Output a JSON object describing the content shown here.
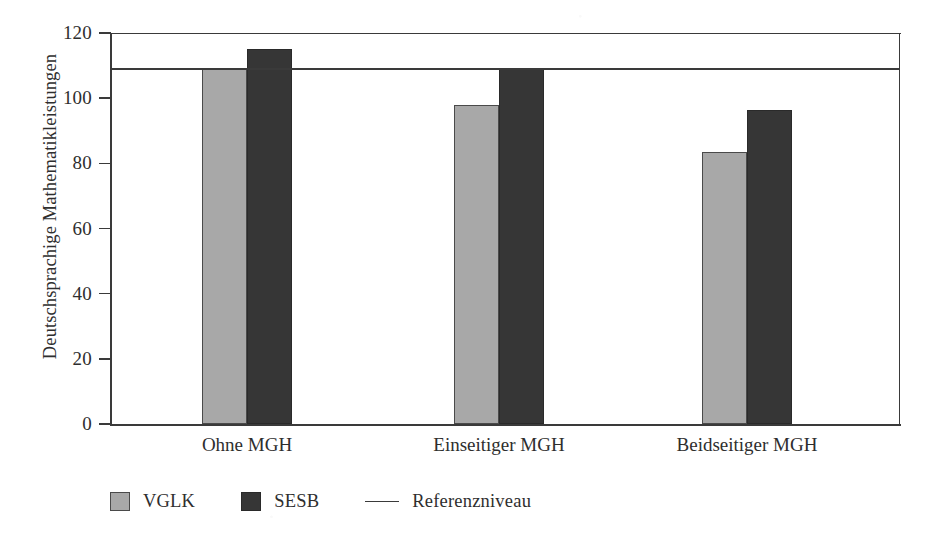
{
  "chart_data": {
    "type": "bar",
    "title": "",
    "subtitle": "",
    "xlabel": "",
    "ylabel": "Deutschsprachige Mathematikleistungen",
    "categories": [
      "Ohne MGH",
      "Einseitiger MGH",
      "Beidseitiger MGH"
    ],
    "series": [
      {
        "name": "VGLK",
        "color": "#a8a8a8",
        "values": [
          109,
          98,
          83.5
        ]
      },
      {
        "name": "SESB",
        "color": "#363636",
        "values": [
          115,
          109,
          96.5
        ]
      }
    ],
    "reference_line": {
      "label": "Referenzniveau",
      "value": 109,
      "color": "#3a3a3a"
    },
    "ylim": [
      0,
      120
    ],
    "yticks": [
      0,
      20,
      40,
      60,
      80,
      100,
      120
    ],
    "ytick_labels": [
      "0",
      "20",
      "40",
      "60",
      "80",
      "100",
      "120"
    ],
    "grid": false,
    "legend_position": "bottom-left",
    "legend_entries": [
      {
        "label": "VGLK",
        "marker": "square",
        "color": "#a8a8a8"
      },
      {
        "label": "SESB",
        "marker": "square",
        "color": "#363636"
      },
      {
        "label": "Referenzniveau",
        "marker": "line",
        "color": "#3a3a3a"
      }
    ]
  }
}
